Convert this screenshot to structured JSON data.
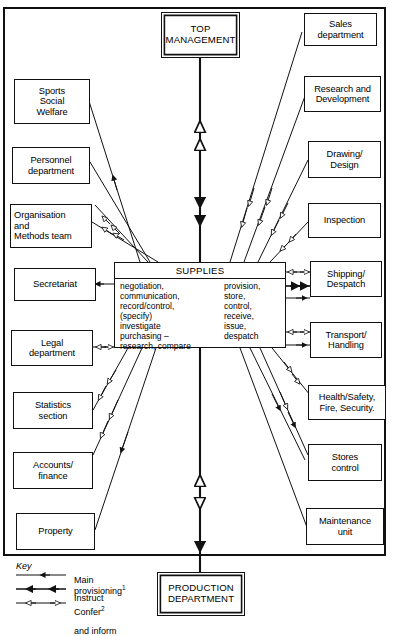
{
  "diagram": {
    "title_box_top": "TOP\nMANAGEMENT",
    "title_box_bottom": "PRODUCTION\nDEPARTMENT",
    "center": {
      "title": "SUPPLIES",
      "column_left": "negotiation,\ncommunication,\nrecord/control,\n(specify)\ninvestigate\npurchasing –\nresearch, compare",
      "column_right": "provision,\nstore,\ncontrol,\nreceive,\nissue,\ndespatch"
    },
    "left_boxes": [
      {
        "label": "Sports\nSocial\nWelfare"
      },
      {
        "label": "Personnel\ndepartment"
      },
      {
        "label": "Organisation\nand\nMethods team"
      },
      {
        "label": "Secretariat"
      },
      {
        "label": "Legal\ndepartment"
      },
      {
        "label": "Statistics\nsection"
      },
      {
        "label": "Accounts/\nfinance"
      },
      {
        "label": "Property"
      }
    ],
    "right_boxes": [
      {
        "label": "Sales\ndepartment"
      },
      {
        "label": "Research and\nDevelopment"
      },
      {
        "label": "Drawing/\nDesign"
      },
      {
        "label": "Inspection"
      },
      {
        "label": "Shipping/\nDespatch"
      },
      {
        "label": "Transport/\nHandling"
      },
      {
        "label": "Health/Safety,\nFire, Security."
      },
      {
        "label": "Stores\ncontrol"
      },
      {
        "label": "Maintenance\nunit"
      }
    ],
    "key": {
      "heading": "Key",
      "rows": [
        {
          "label": "Main\nprovisioning",
          "superscript": "1",
          "style": "single-solid-arrow"
        },
        {
          "label": "Instruct",
          "superscript": "",
          "style": "double-solid-arrow"
        },
        {
          "label": "Confer",
          "superscript": "2",
          "style": "hollow-bidirectional-arrow",
          "label2": "and inform"
        }
      ]
    },
    "colors": {
      "ink": "#111111",
      "paper": "#ffffff"
    }
  }
}
